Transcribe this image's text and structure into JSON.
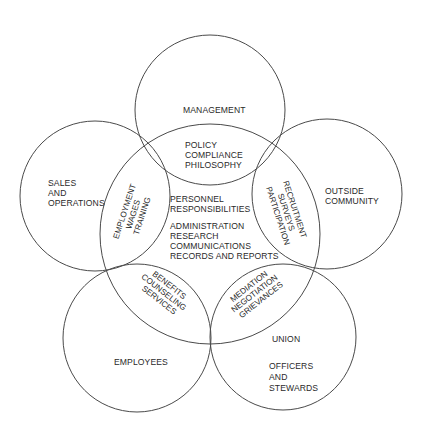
{
  "diagram": {
    "stroke_color": "#4a4a4a",
    "text_color": "#2a2a2a",
    "background": "#ffffff",
    "circles": [
      {
        "id": "management",
        "cx": 210,
        "cy": 110,
        "r": 75
      },
      {
        "id": "sales-operations",
        "cx": 95,
        "cy": 196,
        "r": 75
      },
      {
        "id": "outside-community",
        "cx": 327,
        "cy": 194,
        "r": 75
      },
      {
        "id": "employees",
        "cx": 137,
        "cy": 338,
        "r": 74
      },
      {
        "id": "union",
        "cx": 283,
        "cy": 337,
        "r": 73
      },
      {
        "id": "personnel-center",
        "cx": 210,
        "cy": 234,
        "r": 110
      }
    ],
    "labels": {
      "management": {
        "lines": [
          "MANAGEMENT"
        ]
      },
      "sales_operations": {
        "lines": [
          "SALES",
          "AND",
          "OPERATIONS"
        ]
      },
      "outside_community": {
        "lines": [
          "OUTSIDE",
          "COMMUNITY"
        ]
      },
      "employees": {
        "lines": [
          "EMPLOYEES"
        ]
      },
      "union": {
        "lines": [
          "UNION"
        ]
      },
      "union_members": {
        "lines": [
          "OFFICERS",
          "AND",
          "STEWARDS"
        ]
      },
      "policy": {
        "lines": [
          "POLICY",
          "COMPLIANCE",
          "PHILOSOPHY"
        ]
      },
      "employment": {
        "lines": [
          "EMPLOYMENT",
          "WAGES",
          "TRAINING"
        ]
      },
      "recruitment": {
        "lines": [
          "RECRUITMENT",
          "SURVEYS",
          "PARTICIPATION"
        ]
      },
      "benefits": {
        "lines": [
          "BENEFITS",
          "COUNSELING",
          "SERVICES"
        ]
      },
      "mediation": {
        "lines": [
          "MEDIATION",
          "NEGOTIATION",
          "GRIEVANCES"
        ]
      },
      "personnel": {
        "lines": [
          "PERSONNEL",
          "RESPONSIBILITIES"
        ]
      },
      "admin": {
        "lines": [
          "ADMINISTRATION",
          "RESEARCH",
          "COMMUNICATIONS",
          "RECORDS AND REPORTS"
        ]
      }
    }
  }
}
